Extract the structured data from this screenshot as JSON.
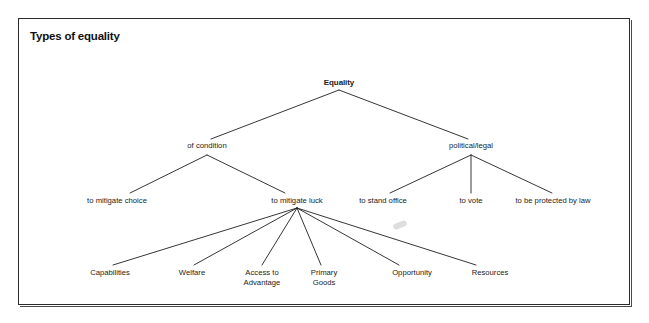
{
  "frame": {
    "title": "Types of equality",
    "border_color": "#2b2b2b",
    "background": "#ffffff"
  },
  "diagram": {
    "type": "tree",
    "line_color": "#1f1f1f",
    "text_color": "#1c1c1c",
    "nodes": {
      "root": {
        "label": "Equality",
        "x": 339,
        "y": 84
      },
      "of_condition": {
        "label": "of condition",
        "x": 207,
        "y": 149
      },
      "political_legal": {
        "label": "political/legal",
        "x": 471,
        "y": 149
      },
      "to_mitigate_choice": {
        "label": "to mitigate choice",
        "x": 117,
        "y": 203
      },
      "to_mitigate_luck": {
        "label": "to mitigate luck",
        "x": 297,
        "y": 203
      },
      "to_stand_office": {
        "label": "to stand office",
        "x": 383,
        "y": 203
      },
      "to_vote": {
        "label": "to vote",
        "x": 471,
        "y": 203
      },
      "to_be_protected_by_law": {
        "label": "to be protected by law",
        "x": 553,
        "y": 203
      },
      "capabilities": {
        "label": "Capabilities",
        "x": 110,
        "y": 272
      },
      "welfare": {
        "label": "Welfare",
        "x": 192,
        "y": 272
      },
      "access_to_advantage": {
        "label": "Access to\nAdvantage",
        "x": 262,
        "y": 272
      },
      "primary_goods": {
        "label": "Primary\nGoods",
        "x": 324,
        "y": 272
      },
      "opportunity": {
        "label": "Opportunity",
        "x": 412,
        "y": 272
      },
      "resources": {
        "label": "Resources",
        "x": 490,
        "y": 272
      }
    },
    "edges": [
      {
        "from": "root",
        "to": "of_condition"
      },
      {
        "from": "root",
        "to": "political_legal"
      },
      {
        "from": "of_condition",
        "to": "to_mitigate_choice"
      },
      {
        "from": "of_condition",
        "to": "to_mitigate_luck"
      },
      {
        "from": "political_legal",
        "to": "to_stand_office"
      },
      {
        "from": "political_legal",
        "to": "to_vote"
      },
      {
        "from": "political_legal",
        "to": "to_be_protected_by_law"
      },
      {
        "from": "to_mitigate_luck",
        "to": "capabilities"
      },
      {
        "from": "to_mitigate_luck",
        "to": "welfare"
      },
      {
        "from": "to_mitigate_luck",
        "to": "access_to_advantage"
      },
      {
        "from": "to_mitigate_luck",
        "to": "primary_goods"
      },
      {
        "from": "to_mitigate_luck",
        "to": "opportunity"
      },
      {
        "from": "to_mitigate_luck",
        "to": "resources"
      }
    ]
  }
}
